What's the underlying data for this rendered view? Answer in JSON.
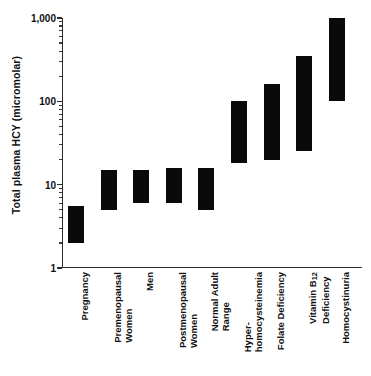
{
  "chart_data": {
    "type": "bar",
    "orientation": "vertical",
    "title": "",
    "xlabel": "",
    "ylabel": "Total plasma HCY (micromolar)",
    "yscale": "log",
    "ylim": [
      1,
      1000
    ],
    "ytick_labels": [
      "1",
      "10",
      "100",
      "1,000"
    ],
    "ytick_values": [
      1,
      10,
      100,
      1000
    ],
    "grid": false,
    "legend": null,
    "value_type": "range",
    "note": "Each bar is a floating range bar spanning low to high plasma homocysteine values.",
    "categories": [
      "Pregnancy",
      "Premenopausal Women",
      "Men",
      "Postmenopausal Women",
      "Normal Adult Range",
      "Hyper-homocysteinemia",
      "Folate Deficiency",
      "Vitamin B12 Deficiency",
      "Homocystinuria"
    ],
    "ranges": [
      {
        "category": "Pregnancy",
        "low": 2.0,
        "high": 5.5
      },
      {
        "category": "Premenopausal Women",
        "low": 5.0,
        "high": 15.0
      },
      {
        "category": "Men",
        "low": 6.0,
        "high": 15.0
      },
      {
        "category": "Postmenopausal Women",
        "low": 6.0,
        "high": 16.0
      },
      {
        "category": "Normal Adult Range",
        "low": 5.0,
        "high": 16.0
      },
      {
        "category": "Hyper-homocysteinemia",
        "low": 18.0,
        "high": 100.0
      },
      {
        "category": "Folate Deficiency",
        "low": 20.0,
        "high": 160.0
      },
      {
        "category": "Vitamin B12 Deficiency",
        "low": 25.0,
        "high": 350.0
      },
      {
        "category": "Homocystinuria",
        "low": 100.0,
        "high": 1000.0
      }
    ]
  },
  "axis": {
    "y_title": "Total plasma HCY (micromolar)",
    "ticks": [
      {
        "label": "1,000",
        "value": 1000
      },
      {
        "label": "100",
        "value": 100
      },
      {
        "label": "10",
        "value": 10
      },
      {
        "label": "1",
        "value": 1
      }
    ]
  },
  "categories": [
    {
      "line1": "Pregnancy",
      "line2": ""
    },
    {
      "line1": "Premenopausal",
      "line2": "Women"
    },
    {
      "line1": "Men",
      "line2": ""
    },
    {
      "line1": "Postmenopausal",
      "line2": "Women"
    },
    {
      "line1": "Normal Adult",
      "line2": "Range"
    },
    {
      "line1": "Hyper-",
      "line2": "homocysteinemia"
    },
    {
      "line1": "Folate Deficiency",
      "line2": ""
    },
    {
      "line1": "Vitamin B12",
      "line2": "Deficiency"
    },
    {
      "line1": "Homocystinuria",
      "line2": ""
    }
  ]
}
